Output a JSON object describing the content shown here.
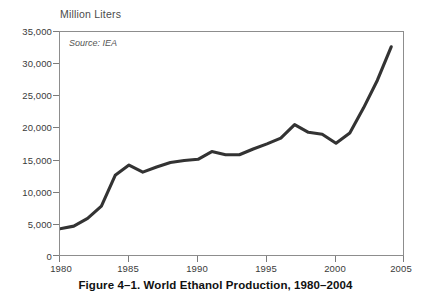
{
  "figure": {
    "caption": "Figure 4–1. World Ethanol Production, 1980–2004",
    "axis_title": "Million Liters",
    "source_note": "Source: IEA",
    "line_color": "#333333",
    "frame_color": "#8d8d8d",
    "background": "#ffffff"
  },
  "chart_data": {
    "type": "line",
    "title": "Figure 4–1. World Ethanol Production, 1980–2004",
    "subtitle": "",
    "xlabel": "",
    "ylabel": "Million Liters",
    "annotations": [
      "Source: IEA"
    ],
    "grid": false,
    "legend": "none",
    "xlim": [
      1980,
      2005
    ],
    "ylim": [
      0,
      35000
    ],
    "xticks": [
      1980,
      1985,
      1990,
      1995,
      2000,
      2005
    ],
    "xtick_labels": [
      "1980",
      "1985",
      "1990",
      "1995",
      "2000",
      "2005"
    ],
    "yticks": [
      0,
      5000,
      10000,
      15000,
      20000,
      25000,
      30000,
      35000
    ],
    "ytick_labels": [
      "0",
      "5,000",
      "10,000",
      "15,000",
      "20,000",
      "25,000",
      "30,000",
      "35,000"
    ],
    "x": [
      1980,
      1981,
      1982,
      1983,
      1984,
      1985,
      1986,
      1987,
      1988,
      1989,
      1990,
      1991,
      1992,
      1993,
      1994,
      1995,
      1996,
      1997,
      1998,
      1999,
      2000,
      2001,
      2002,
      2003,
      2004
    ],
    "series": [
      {
        "name": "World Ethanol Production",
        "units": "Million Liters",
        "values": [
          4400,
          4800,
          6000,
          7900,
          12700,
          14300,
          13200,
          14000,
          14700,
          15000,
          15200,
          16400,
          15900,
          15900,
          16800,
          17600,
          18500,
          20600,
          19400,
          19100,
          17700,
          19300,
          23200,
          27500,
          32700
        ]
      }
    ]
  }
}
